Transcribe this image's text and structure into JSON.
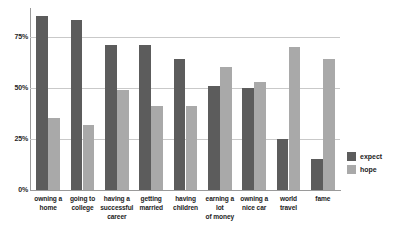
{
  "chart_data": {
    "type": "bar",
    "title": "",
    "xlabel": "",
    "ylabel": "",
    "ylim": [
      0,
      87.5
    ],
    "grid": true,
    "legend_position": "right",
    "y_ticks": [
      "0%",
      "25%",
      "50%",
      "75%"
    ],
    "y_tick_values": [
      0,
      25,
      50,
      75
    ],
    "categories": [
      "owning a home",
      "going to college",
      "having a successful career",
      "getting married",
      "having children",
      "earning a lot of money",
      "owning a nice car",
      "world travel",
      "fame"
    ],
    "category_lines": [
      [
        "owning a",
        "home"
      ],
      [
        "going to",
        "college"
      ],
      [
        "having a",
        "successful",
        "career"
      ],
      [
        "getting",
        "married"
      ],
      [
        "having",
        "children"
      ],
      [
        "earning a lot",
        "of money"
      ],
      [
        "owning a",
        "nice car"
      ],
      [
        "world",
        "travel"
      ],
      [
        "fame"
      ]
    ],
    "series": [
      {
        "name": "expect",
        "color": "#5c5c5c",
        "values": [
          85,
          83,
          71,
          71,
          64,
          51,
          50,
          25,
          15
        ]
      },
      {
        "name": "hope",
        "color": "#a9a9a9",
        "values": [
          35,
          32,
          49,
          41,
          41,
          60,
          53,
          70,
          64
        ]
      }
    ]
  },
  "legend": {
    "items": [
      {
        "label": "expect",
        "color": "#5c5c5c"
      },
      {
        "label": "hope",
        "color": "#a9a9a9"
      }
    ]
  }
}
